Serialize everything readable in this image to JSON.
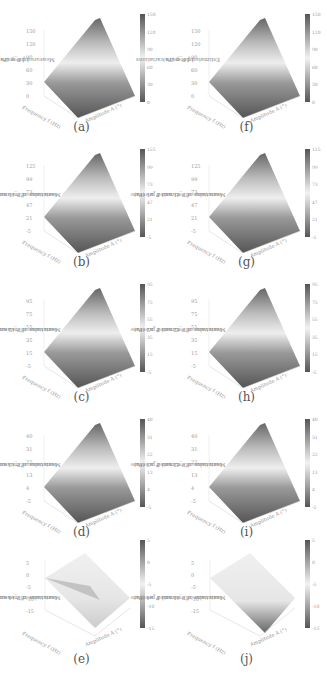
{
  "figure": {
    "panels": [
      {
        "id": "a",
        "caption": "(a)",
        "ylabel_line1": "Measured pressure variations",
        "ylabel_line2": "of P_g (Pa)",
        "zticks": [
          "150",
          "120",
          "90",
          "60",
          "30",
          "0"
        ],
        "cbar_ticks": [
          "150",
          "120",
          "90",
          "60",
          "30",
          "0"
        ],
        "freq_label": "Frequency f (Hz)",
        "amp_label": "Amplitude A (°)"
      },
      {
        "id": "f",
        "caption": "(f)",
        "ylabel_line1": "Estimated pressure variations",
        "ylabel_line2": "of P_g (Pa)",
        "zticks": [
          "150",
          "120",
          "90",
          "60",
          "30",
          "0"
        ],
        "cbar_ticks": [
          "150",
          "120",
          "90",
          "60",
          "30",
          "0"
        ],
        "freq_label": "Frequency f (Hz)",
        "amp_label": "Amplitude A (°)"
      },
      {
        "id": "b",
        "caption": "(b)",
        "ylabel_line1": "Mean value of measured pressure",
        "ylabel_line2": "variations of P_t1 and P_a1 (Pa)",
        "zticks": [
          "125",
          "99",
          "73",
          "47",
          "21",
          "-5"
        ],
        "cbar_ticks": [
          "125",
          "99",
          "73",
          "47",
          "21",
          "-5"
        ],
        "freq_label": "Frequency f (Hz)",
        "amp_label": "Amplitude A (°)"
      },
      {
        "id": "g",
        "caption": "(g)",
        "ylabel_line1": "Mean value of estimated pressure",
        "ylabel_line2": "variations of P_t1 and P_a1 (Pa)",
        "zticks": [
          "125",
          "99",
          "73",
          "47",
          "21",
          "-5"
        ],
        "cbar_ticks": [
          "125",
          "99",
          "73",
          "47",
          "21",
          "-5"
        ],
        "freq_label": "Frequency f (Hz)",
        "amp_label": "Amplitude A (°)"
      },
      {
        "id": "c",
        "caption": "(c)",
        "ylabel_line1": "Mean value of measured pressure",
        "ylabel_line2": "variations of P_t2 and P_a2 (Pa)",
        "zticks": [
          "95",
          "75",
          "55",
          "35",
          "15",
          "-5"
        ],
        "cbar_ticks": [
          "95",
          "75",
          "55",
          "35",
          "15",
          "-5"
        ],
        "freq_label": "Frequency f (Hz)",
        "amp_label": "Amplitude A (°)"
      },
      {
        "id": "h",
        "caption": "(h)",
        "ylabel_line1": "Mean value of estimated pressure",
        "ylabel_line2": "variations of P_t2 and P_a2 (Pa)",
        "zticks": [
          "95",
          "75",
          "55",
          "35",
          "15",
          "-5"
        ],
        "cbar_ticks": [
          "95",
          "75",
          "55",
          "35",
          "15",
          "-5"
        ],
        "freq_label": "Frequency f (Hz)",
        "amp_label": "Amplitude A (°)"
      },
      {
        "id": "d",
        "caption": "(d)",
        "ylabel_line1": "Mean value of measured pressure",
        "ylabel_line2": "variations of P_t3 and P_a3 (Pa)",
        "zticks": [
          "40",
          "31",
          "22",
          "13",
          "4",
          "-5"
        ],
        "cbar_ticks": [
          "40",
          "31",
          "22",
          "13",
          "4",
          "-5"
        ],
        "freq_label": "Frequency f (Hz)",
        "amp_label": "Amplitude A (°)"
      },
      {
        "id": "i",
        "caption": "(i)",
        "ylabel_line1": "Mean value of estimated pressure",
        "ylabel_line2": "variations of P_t3 and P_a3 (Pa)",
        "zticks": [
          "40",
          "31",
          "22",
          "13",
          "4",
          "-5"
        ],
        "cbar_ticks": [
          "40",
          "31",
          "22",
          "13",
          "4",
          "-5"
        ],
        "freq_label": "Frequency f (Hz)",
        "amp_label": "Amplitude A (°)"
      },
      {
        "id": "e",
        "caption": "(e)",
        "ylabel_line1": "Mean value of measured pressure",
        "ylabel_line2": "variations of P_t4 and P_a4 (Pa)",
        "zticks": [
          "5",
          "0",
          "-5",
          "-10",
          "-15"
        ],
        "cbar_ticks": [
          "5",
          "0",
          "-5",
          "-10",
          "-15"
        ],
        "freq_label": "Frequency f (Hz)",
        "amp_label": "Amplitude A (°)"
      },
      {
        "id": "j",
        "caption": "(j)",
        "ylabel_line1": "Mean value of estimated pressure",
        "ylabel_line2": "variations of P_t4 and P_a4 (Pa)",
        "zticks": [
          "5",
          "0",
          "-5",
          "-10",
          "-15"
        ],
        "cbar_ticks": [
          "5",
          "0",
          "-5",
          "-10",
          "-15"
        ],
        "freq_label": "Frequency f (Hz)",
        "amp_label": "Amplitude A (°)"
      }
    ]
  },
  "chart_data": [
    {
      "type": "heatmap",
      "subtype": "3d-surface",
      "panel": "a",
      "title": "(a)",
      "xlabel": "Frequency f (Hz)",
      "ylabel": "Amplitude A (°)",
      "zlabel": "Measured pressure variations of P_g (Pa)",
      "x_ticks": [
        2.0,
        1.8,
        1.6,
        1.4,
        1.2,
        1.0
      ],
      "y_ticks": [
        5,
        10,
        15,
        20,
        25,
        30
      ],
      "zlim": [
        0,
        150
      ],
      "z_ticks": [
        0,
        30,
        60,
        90,
        120,
        150
      ],
      "colorbar": [
        0,
        150
      ],
      "corners": {
        "f1.0_A5": 0,
        "f2.0_A5": 25,
        "f1.0_A30": 5,
        "f2.0_A30": 150
      }
    },
    {
      "type": "heatmap",
      "subtype": "3d-surface",
      "panel": "f",
      "title": "(f)",
      "xlabel": "Frequency f (Hz)",
      "ylabel": "Amplitude A (°)",
      "zlabel": "Estimated pressure variations of P_g (Pa)",
      "x_ticks": [
        2.0,
        1.8,
        1.6,
        1.4,
        1.2,
        1.0
      ],
      "y_ticks": [
        5,
        10,
        15,
        20,
        25,
        30
      ],
      "zlim": [
        0,
        150
      ],
      "z_ticks": [
        0,
        30,
        60,
        90,
        120,
        150
      ],
      "colorbar": [
        0,
        150
      ],
      "corners": {
        "f1.0_A5": 0,
        "f2.0_A5": 25,
        "f1.0_A30": 5,
        "f2.0_A30": 150
      }
    },
    {
      "type": "heatmap",
      "subtype": "3d-surface",
      "panel": "b",
      "title": "(b)",
      "xlabel": "Frequency f (Hz)",
      "ylabel": "Amplitude A (°)",
      "zlabel": "Mean value of measured pressure variations of P_t1 and P_a1 (Pa)",
      "zlim": [
        -5,
        125
      ],
      "z_ticks": [
        -5,
        21,
        47,
        73,
        99,
        125
      ],
      "colorbar": [
        -5,
        125
      ],
      "corners": {
        "f1.0_A5": 0,
        "f2.0_A5": 21,
        "f1.0_A30": 5,
        "f2.0_A30": 125
      }
    },
    {
      "type": "heatmap",
      "subtype": "3d-surface",
      "panel": "g",
      "title": "(g)",
      "xlabel": "Frequency f (Hz)",
      "ylabel": "Amplitude A (°)",
      "zlabel": "Mean value of estimated pressure variations of P_t1 and P_a1 (Pa)",
      "zlim": [
        -5,
        125
      ],
      "z_ticks": [
        -5,
        21,
        47,
        73,
        99,
        125
      ],
      "colorbar": [
        -5,
        125
      ],
      "corners": {
        "f1.0_A5": 0,
        "f2.0_A5": 21,
        "f1.0_A30": 5,
        "f2.0_A30": 125
      }
    },
    {
      "type": "heatmap",
      "subtype": "3d-surface",
      "panel": "c",
      "title": "(c)",
      "xlabel": "Frequency f (Hz)",
      "ylabel": "Amplitude A (°)",
      "zlabel": "Mean value of measured pressure variations of P_t2 and P_a2 (Pa)",
      "zlim": [
        -5,
        95
      ],
      "z_ticks": [
        -5,
        15,
        35,
        55,
        75,
        95
      ],
      "colorbar": [
        -5,
        95
      ],
      "corners": {
        "f1.0_A5": 0,
        "f2.0_A5": 15,
        "f1.0_A30": 5,
        "f2.0_A30": 95
      }
    },
    {
      "type": "heatmap",
      "subtype": "3d-surface",
      "panel": "h",
      "title": "(h)",
      "xlabel": "Frequency f (Hz)",
      "ylabel": "Amplitude A (°)",
      "zlabel": "Mean value of estimated pressure variations of P_t2 and P_a2 (Pa)",
      "zlim": [
        -5,
        95
      ],
      "z_ticks": [
        -5,
        15,
        35,
        55,
        75,
        95
      ],
      "colorbar": [
        -5,
        95
      ],
      "corners": {
        "f1.0_A5": 0,
        "f2.0_A5": 15,
        "f1.0_A30": 5,
        "f2.0_A30": 95
      }
    },
    {
      "type": "heatmap",
      "subtype": "3d-surface",
      "panel": "d",
      "title": "(d)",
      "xlabel": "Frequency f (Hz)",
      "ylabel": "Amplitude A (°)",
      "zlabel": "Mean value of measured pressure variations of P_t3 and P_a3 (Pa)",
      "zlim": [
        -5,
        40
      ],
      "z_ticks": [
        -5,
        4,
        13,
        22,
        31,
        40
      ],
      "colorbar": [
        -5,
        40
      ],
      "corners": {
        "f1.0_A5": 0,
        "f2.0_A5": 4,
        "f1.0_A30": 2,
        "f2.0_A30": 40
      }
    },
    {
      "type": "heatmap",
      "subtype": "3d-surface",
      "panel": "i",
      "title": "(i)",
      "xlabel": "Frequency f (Hz)",
      "ylabel": "Amplitude A (°)",
      "zlabel": "Mean value of estimated pressure variations of P_t3 and P_a3 (Pa)",
      "zlim": [
        -5,
        40
      ],
      "z_ticks": [
        -5,
        4,
        13,
        22,
        31,
        40
      ],
      "colorbar": [
        -5,
        40
      ],
      "corners": {
        "f1.0_A5": 0,
        "f2.0_A5": 4,
        "f1.0_A30": 2,
        "f2.0_A30": 40
      }
    },
    {
      "type": "heatmap",
      "subtype": "3d-surface",
      "panel": "e",
      "title": "(e)",
      "xlabel": "Frequency f (Hz)",
      "ylabel": "Amplitude A (°)",
      "zlabel": "Mean value of measured pressure variations of P_t4 and P_a4 (Pa)",
      "x_ticks": [
        1.0,
        1.2,
        1.4,
        1.6,
        1.8,
        2.0
      ],
      "y_ticks": [
        30,
        25,
        20,
        15,
        10,
        5
      ],
      "zlim": [
        -15,
        5
      ],
      "z_ticks": [
        -15,
        -10,
        -5,
        0,
        5
      ],
      "colorbar": [
        -15,
        5
      ],
      "corners": {
        "f1.0_A5": 0,
        "f2.0_A5": 0,
        "f1.0_A30": -3,
        "f2.0_A30": -2
      }
    },
    {
      "type": "heatmap",
      "subtype": "3d-surface",
      "panel": "j",
      "title": "(j)",
      "xlabel": "Frequency f (Hz)",
      "ylabel": "Amplitude A (°)",
      "zlabel": "Mean value of estimated pressure variations of P_t4 and P_a4 (Pa)",
      "x_ticks": [
        1.0,
        1.2,
        1.4,
        1.6,
        1.8,
        2.0
      ],
      "y_ticks": [
        30,
        25,
        20,
        15,
        10,
        5
      ],
      "zlim": [
        -15,
        5
      ],
      "z_ticks": [
        -15,
        -10,
        -5,
        0,
        5
      ],
      "colorbar": [
        -15,
        5
      ],
      "corners": {
        "f1.0_A5": 0,
        "f2.0_A5": 0,
        "f1.0_A30": 0,
        "f2.0_A30": -14
      }
    }
  ]
}
